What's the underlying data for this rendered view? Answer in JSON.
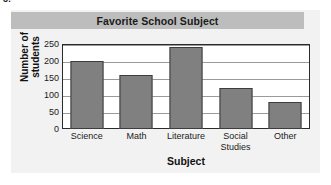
{
  "exercise": {
    "number": "3."
  },
  "card": {
    "title": "Favorite School Subject"
  },
  "chart_data": {
    "type": "bar",
    "title": "Favorite School Subject",
    "xlabel": "Subject",
    "ylabel": "Number of\nstudents",
    "categories": [
      "Science",
      "Math",
      "Literature",
      "Social\nStudies",
      "Other"
    ],
    "values": [
      200,
      160,
      240,
      120,
      80
    ],
    "ylim": [
      0,
      250
    ],
    "yticks": [
      0,
      50,
      100,
      150,
      200,
      250
    ],
    "ytick_labels": [
      "0",
      "50",
      "100",
      "150",
      "200",
      "250"
    ],
    "grid": true,
    "grid_axis": "y",
    "legend": false,
    "bar_color": "#808080",
    "bar_edge_color": "#3d3d3d",
    "plot_background": "#ffffff",
    "card_background": "#f2f2f2",
    "title_bar_color": "#bdbdbd"
  }
}
